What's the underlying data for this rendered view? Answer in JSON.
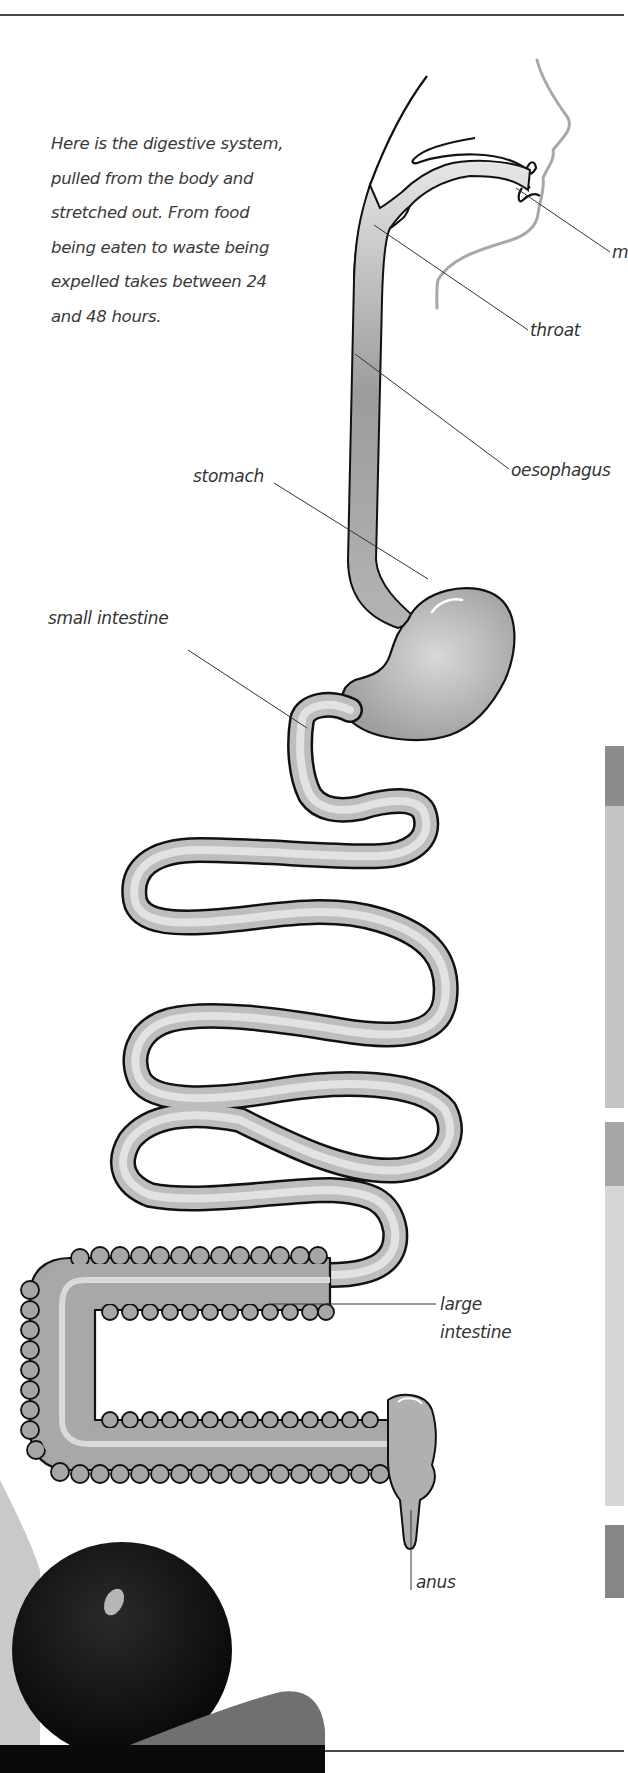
{
  "intro_text": "Here is the digestive system, pulled from the body and stretched out. From food being eaten to waste being expelled takes between 24 and 48 hours.",
  "labels": {
    "mouth": "m",
    "throat": "throat",
    "oesophagus": "oesophagus",
    "stomach": "stomach",
    "small_intestine": "small intestine",
    "large_intestine_line1": "large",
    "large_intestine_line2": "intestine",
    "anus": "anus"
  },
  "colors": {
    "rule": "#4a4a4a",
    "organ_fill": "#c8c8c8",
    "organ_outline": "#111111",
    "band_dark": "#8c8c8c",
    "band_light": "#c4c4c4",
    "band_medium": "#a6a6a6",
    "band_lighter": "#d6d6d6",
    "band_bottom": "#868686"
  }
}
